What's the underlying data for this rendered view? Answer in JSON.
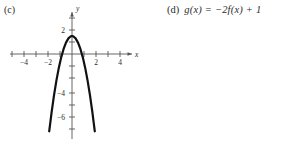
{
  "parts": {
    "c_label": "(c)",
    "d_label": "(d)",
    "d_formula": "g(x) = −2f(x) + 1"
  },
  "chart_data": {
    "type": "line",
    "title": "",
    "xlabel": "x",
    "ylabel": "y",
    "grid": false,
    "legend": "none",
    "xlim": [
      -5.2,
      5.2
    ],
    "ylim": [
      -7.6,
      2.9
    ],
    "x_ticks": [
      -5,
      -4,
      -3,
      -2,
      -1,
      1,
      2,
      3,
      4,
      5
    ],
    "y_ticks": [
      -7,
      -6,
      -5,
      -4,
      -3,
      -2,
      -1,
      1,
      2
    ],
    "x_tick_labels": [
      {
        "value": -4,
        "text": "−4"
      },
      {
        "value": -2,
        "text": "−2"
      },
      {
        "value": 2,
        "text": "2"
      },
      {
        "value": 4,
        "text": "4"
      }
    ],
    "y_tick_labels": [
      {
        "value": 2,
        "text": "2"
      },
      {
        "value": -4,
        "text": "−4"
      },
      {
        "value": -6,
        "text": "−6"
      }
    ],
    "series": [
      {
        "name": "parabola",
        "equation": "y = -2.2x^2 + 1.5",
        "vertex": [
          0,
          1.5
        ],
        "opens": "down",
        "color": "#111111",
        "linewidth": 2.2,
        "x": [
          -1.9,
          -1.7,
          -1.5,
          -1.3,
          -1.1,
          -0.9,
          -0.7,
          -0.5,
          -0.3,
          -0.1,
          0,
          0.1,
          0.3,
          0.5,
          0.7,
          0.9,
          1.1,
          1.3,
          1.5,
          1.7,
          1.9
        ],
        "values": [
          -6.44,
          -4.86,
          -3.45,
          -2.22,
          -1.16,
          -0.28,
          0.42,
          0.95,
          1.3,
          1.48,
          1.5,
          1.48,
          1.3,
          0.95,
          0.42,
          -0.28,
          -1.16,
          -2.22,
          -3.45,
          -4.86,
          -6.44
        ]
      }
    ],
    "axis_color": "#555555",
    "axis_label_x": "x",
    "axis_label_y": "y"
  }
}
